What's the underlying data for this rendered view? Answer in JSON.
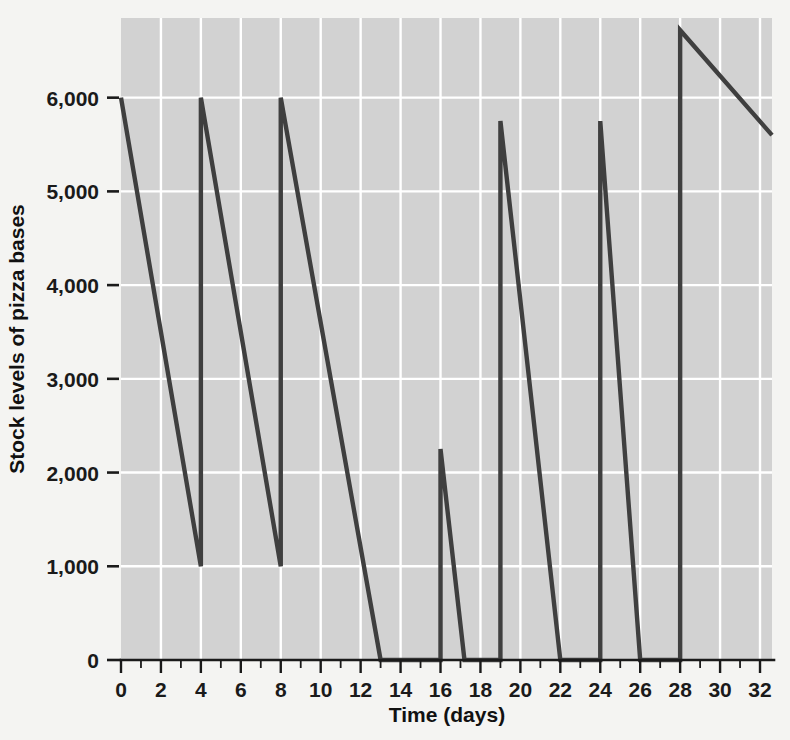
{
  "chart_data": {
    "type": "line",
    "title": "",
    "subtitle": "",
    "xlabel": "Time (days)",
    "ylabel": "Stock levels of pizza bases",
    "xlim": [
      0,
      32.6
    ],
    "ylim": [
      0,
      6850
    ],
    "grid": true,
    "legend": null,
    "x_tick_labels": [
      "0",
      "2",
      "4",
      "6",
      "8",
      "10",
      "12",
      "14",
      "16",
      "18",
      "20",
      "22",
      "24",
      "26",
      "28",
      "30",
      "32"
    ],
    "x_tick_values": [
      0,
      2,
      4,
      6,
      8,
      10,
      12,
      14,
      16,
      18,
      20,
      22,
      24,
      26,
      28,
      30,
      32
    ],
    "x_minor_interval": 1,
    "y_tick_labels": [
      "0",
      "1,000",
      "2,000",
      "3,000",
      "4,000",
      "5,000",
      "6,000"
    ],
    "y_tick_values": [
      0,
      1000,
      2000,
      3000,
      4000,
      5000,
      6000
    ],
    "series": [
      {
        "name": "Stock level",
        "points": [
          [
            0,
            6000
          ],
          [
            4,
            1000
          ],
          [
            4,
            6000
          ],
          [
            8,
            1000
          ],
          [
            8,
            6000
          ],
          [
            13,
            0
          ],
          [
            16,
            0
          ],
          [
            16,
            2250
          ],
          [
            17.2,
            0
          ],
          [
            19,
            0
          ],
          [
            19,
            5750
          ],
          [
            22,
            0
          ],
          [
            24,
            0
          ],
          [
            24,
            5750
          ],
          [
            26,
            0
          ],
          [
            28,
            0
          ],
          [
            28,
            6720
          ],
          [
            32.6,
            5600
          ]
        ]
      }
    ],
    "colors": {
      "line": "#3f3f3f",
      "plot_background": "#d2d2d2",
      "grid": "#ffffff",
      "page_background": "#f4f4f2",
      "text": "#1a1a1a"
    }
  }
}
